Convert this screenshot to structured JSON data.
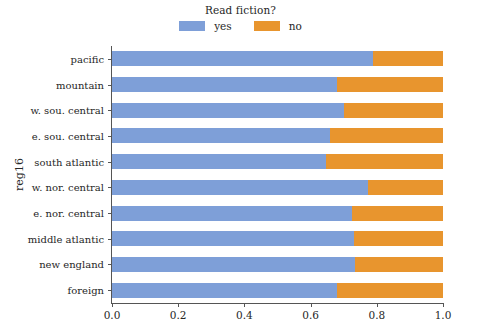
{
  "chart_data": {
    "type": "bar",
    "orientation": "horizontal",
    "stacked": true,
    "normalized": true,
    "title": "",
    "xlabel": "",
    "ylabel": "reg16",
    "xlim": [
      0.0,
      1.0
    ],
    "xticks": [
      "0.0",
      "0.2",
      "0.4",
      "0.6",
      "0.8",
      "1.0"
    ],
    "xtick_values": [
      0.0,
      0.2,
      0.4,
      0.6,
      0.8,
      1.0
    ],
    "grid": false,
    "legend": {
      "title": "Read fiction?",
      "position": "top-center",
      "entries": [
        {
          "label": "yes",
          "color": "#7e9fd8"
        },
        {
          "label": "no",
          "color": "#e8952e"
        }
      ]
    },
    "categories": [
      "pacific",
      "mountain",
      "w. sou. central",
      "e. sou. central",
      "south atlantic",
      "w. nor. central",
      "e. nor. central",
      "middle atlantic",
      "new england",
      "foreign"
    ],
    "series": [
      {
        "name": "yes",
        "color": "#7e9fd8",
        "values": [
          0.79,
          0.68,
          0.7,
          0.66,
          0.646,
          0.773,
          0.725,
          0.73,
          0.734,
          0.68
        ]
      },
      {
        "name": "no",
        "color": "#e8952e",
        "values": [
          0.21,
          0.32,
          0.3,
          0.34,
          0.354,
          0.227,
          0.275,
          0.27,
          0.266,
          0.32
        ]
      }
    ]
  },
  "colors": {
    "blue": "#7e9fd8",
    "orange": "#e8952e",
    "axis": "#555555",
    "text": "#262626",
    "background": "#ffffff"
  }
}
